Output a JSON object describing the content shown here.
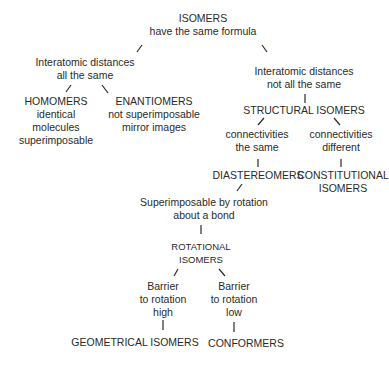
{
  "diagram": {
    "nodes": {
      "isomers": {
        "title": "ISOMERS",
        "sub": "have the same formula"
      },
      "same_dist": {
        "l1": "Interatomic distances",
        "l2": "all the same"
      },
      "diff_dist": {
        "l1": "Interatomic distances",
        "l2": "not all the same"
      },
      "homomers": {
        "title": "HOMOMERS",
        "l1": "identical",
        "l2": "molecules",
        "l3": "superimposable"
      },
      "enantiomers": {
        "title": "ENANTIOMERS",
        "l1": "not superimposable",
        "l2": "mirror images"
      },
      "structural": {
        "title": "STRUCTURAL ISOMERS"
      },
      "conn_same": {
        "l1": "connectivities",
        "l2": "the same"
      },
      "conn_diff": {
        "l1": "connectivities",
        "l2": "different"
      },
      "diastereomers": {
        "title": "DIASTEREOMERS"
      },
      "constitutional": {
        "l1": "CONSTITUTIONAL",
        "l2": "ISOMERS"
      },
      "superimposable_rot": {
        "l1": "Superimposable by rotation",
        "l2": "about a bond"
      },
      "rotational": {
        "l1": "ROTATIONAL",
        "l2": "ISOMERS"
      },
      "barrier_high": {
        "l1": "Barrier",
        "l2": "to rotation",
        "l3": "high"
      },
      "barrier_low": {
        "l1": "Barrier",
        "l2": "to rotation",
        "l3": "low"
      },
      "geometrical": {
        "title": "GEOMETRICAL ISOMERS"
      },
      "conformers": {
        "title": "CONFORMERS"
      }
    }
  }
}
